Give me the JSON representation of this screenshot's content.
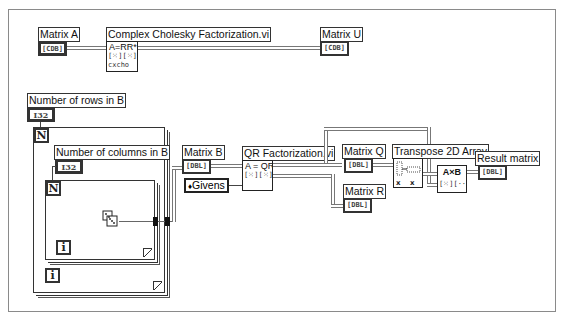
{
  "diagram": {
    "type": "LabVIEW block diagram",
    "top_section": {
      "matrix_a": {
        "label": "Matrix A",
        "type": "[CDB]"
      },
      "cholesky_node": {
        "label": "Complex Cholesky Factorization.vi",
        "icon_line1": "A=RR*",
        "icon_line2": "[⁙][⁙][⁙]",
        "icon_line3": "cxcho"
      },
      "matrix_u": {
        "label": "Matrix U",
        "type": "[CDB]"
      }
    },
    "bottom_section": {
      "rows_control": {
        "label": "Number of rows in B",
        "type": "I32"
      },
      "cols_control": {
        "label": "Number of columns in B",
        "type": "I32"
      },
      "outer_loop": {
        "count_terminal": "N",
        "iteration_terminal": "i"
      },
      "inner_loop": {
        "count_terminal": "N",
        "iteration_terminal": "i"
      },
      "random_node": {
        "icon": "dice-icon"
      },
      "matrix_b": {
        "label": "Matrix B",
        "type": "[DBL]"
      },
      "givens": {
        "label": "Givens",
        "glyph": "♦"
      },
      "qr_node": {
        "label": "QR Factorization.vi",
        "icon_line1": "A = QR",
        "icon_line2": "[⁙][⁙][⁙]"
      },
      "matrix_q": {
        "label": "Matrix Q",
        "type": "[DBL]"
      },
      "matrix_r": {
        "label": "Matrix R",
        "type": "[DBL]"
      },
      "transpose_node": {
        "label": "Transpose 2D Array",
        "sub_left": "xᵢⱼ",
        "sub_right": "xⱼᵢ"
      },
      "multiply_node": {
        "icon_line1": "A×B",
        "icon_line2": "[⁙][··][⁙]"
      },
      "result_matrix": {
        "label": "Result matrix",
        "type": "[DBL]"
      }
    }
  }
}
